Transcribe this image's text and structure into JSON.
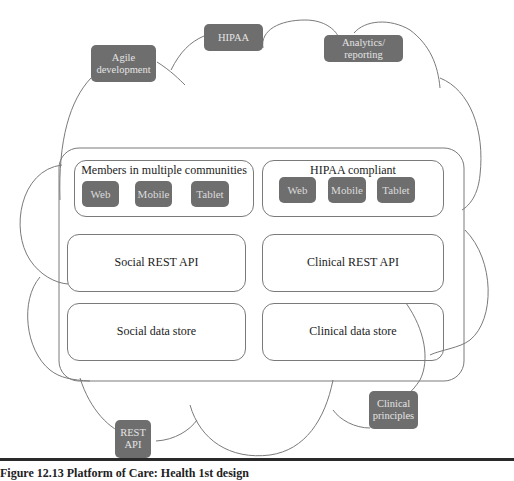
{
  "tags": {
    "agile": "Agile development",
    "hipaa": "HIPAA",
    "analytics": "Analytics/ reporting",
    "rest_api": "REST API",
    "clinical_principles": "Clinical principles"
  },
  "left_column": {
    "clients_title": "Members in multiple communities",
    "clients": [
      "Web",
      "Mobile",
      "Tablet"
    ],
    "api": "Social REST API",
    "store": "Social data store"
  },
  "right_column": {
    "clients_title": "HIPAA  compliant",
    "clients": [
      "Web",
      "Mobile",
      "Tablet"
    ],
    "api": "Clinical REST API",
    "store": "Clinical data store"
  },
  "caption": "Figure 12.13   Platform of Care: Health 1st design",
  "colors": {
    "tag_fill": "#6e6e6e",
    "tag_text": "#e4e4e4",
    "line": "#7a7a7a"
  }
}
